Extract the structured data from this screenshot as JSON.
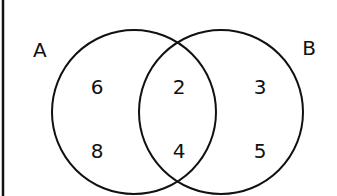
{
  "diagram": {
    "type": "venn",
    "sets": [
      {
        "name": "A",
        "label": "A"
      },
      {
        "name": "B",
        "label": "B"
      }
    ],
    "regions": {
      "a_only": [
        "6",
        "8"
      ],
      "intersection": [
        "2",
        "4"
      ],
      "b_only": [
        "3",
        "5"
      ]
    },
    "colors": {
      "stroke": "#111111",
      "background": "#ffffff"
    }
  }
}
